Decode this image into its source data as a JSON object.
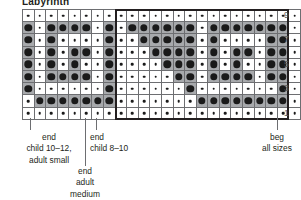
{
  "chart_data": {
    "type": "heatmap",
    "title": "Labyrinth",
    "rows": 9,
    "columns": 24,
    "row_labels": [
      "9",
      "",
      "7",
      "",
      "5",
      "",
      "3",
      "",
      "1"
    ],
    "row_label_positions": [
      1,
      3,
      5,
      7,
      9
    ],
    "legend": [
      {
        "key": "small-dot",
        "meaning": "background stitch",
        "cell": "white",
        "dot": "small"
      },
      {
        "key": "big-dot",
        "meaning": "pattern stitch",
        "cell": "shaded",
        "dot": "big"
      }
    ],
    "repeat_box": {
      "start_column": 9,
      "end_column": 23,
      "label": "pattern repeat"
    },
    "cells": [
      [
        0,
        0,
        0,
        0,
        0,
        0,
        0,
        0,
        0,
        0,
        0,
        0,
        0,
        0,
        0,
        0,
        0,
        0,
        0,
        0,
        0,
        0,
        0,
        0
      ],
      [
        1,
        0,
        1,
        1,
        1,
        1,
        0,
        1,
        0,
        1,
        1,
        1,
        1,
        1,
        1,
        0,
        1,
        1,
        1,
        1,
        1,
        1,
        1,
        0
      ],
      [
        1,
        0,
        1,
        0,
        0,
        0,
        0,
        1,
        0,
        0,
        1,
        1,
        1,
        1,
        1,
        0,
        1,
        0,
        0,
        0,
        0,
        1,
        1,
        0
      ],
      [
        1,
        0,
        1,
        0,
        1,
        1,
        0,
        1,
        0,
        0,
        0,
        1,
        1,
        1,
        1,
        0,
        1,
        0,
        1,
        1,
        0,
        1,
        1,
        0
      ],
      [
        1,
        0,
        1,
        0,
        1,
        0,
        0,
        1,
        0,
        0,
        0,
        0,
        1,
        1,
        1,
        0,
        1,
        0,
        1,
        0,
        0,
        1,
        1,
        0
      ],
      [
        1,
        0,
        1,
        1,
        1,
        1,
        0,
        1,
        0,
        0,
        0,
        0,
        0,
        1,
        1,
        0,
        1,
        1,
        1,
        1,
        0,
        1,
        1,
        0
      ],
      [
        1,
        0,
        0,
        0,
        0,
        0,
        0,
        1,
        0,
        0,
        0,
        0,
        0,
        0,
        1,
        0,
        0,
        0,
        0,
        0,
        0,
        0,
        1,
        0
      ],
      [
        0,
        1,
        1,
        1,
        1,
        1,
        1,
        1,
        0,
        0,
        0,
        0,
        0,
        0,
        0,
        1,
        1,
        1,
        1,
        1,
        1,
        1,
        1,
        0
      ],
      [
        0,
        0,
        0,
        0,
        0,
        0,
        0,
        0,
        0,
        0,
        0,
        0,
        0,
        0,
        0,
        0,
        0,
        0,
        0,
        0,
        0,
        0,
        0,
        0
      ]
    ]
  },
  "annotations": [
    {
      "id": "end-child-10-12-adult-small",
      "text": "end\nchild 10–12,\nadult small"
    },
    {
      "id": "end-adult-medium",
      "text": "end\nadult\nmedium"
    },
    {
      "id": "end-child-8-10",
      "text": "end\nchild 8–10"
    },
    {
      "id": "beg-all-sizes",
      "text": "beg\nall sizes"
    }
  ],
  "colors": {
    "shaded_cell": "#a7a9ac",
    "plain_cell": "#ffffff",
    "dot": "#1a1a1a",
    "grid_line": "#6d6e71",
    "repeat_border": "#231f20",
    "text": "#231f20",
    "row_number": "#58595b"
  }
}
